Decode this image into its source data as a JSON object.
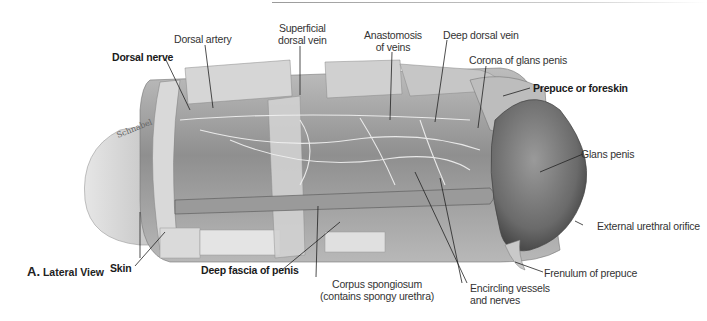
{
  "figure": {
    "panel_letter": "A.",
    "panel_title": "Lateral View",
    "signature": "Schnabel"
  },
  "labels": {
    "dorsal_nerve": "Dorsal nerve",
    "dorsal_artery": "Dorsal artery",
    "superficial_dorsal_vein": [
      "Superficial",
      "dorsal vein"
    ],
    "anastomosis_of_veins": [
      "Anastomosis",
      "of veins"
    ],
    "deep_dorsal_vein": "Deep dorsal vein",
    "corona_of_glans_penis": "Corona of glans penis",
    "prepuce_or_foreskin": "Prepuce or foreskin",
    "glans_penis": "Glans penis",
    "external_urethral_orifice": "External urethral orifice",
    "frenulum_of_prepuce": "Frenulum of prepuce",
    "encircling_vessels_and_nerves": [
      "Encircling vessels",
      "and nerves"
    ],
    "corpus_spongiosum": [
      "Corpus spongiosum",
      "(contains spongy urethra)"
    ],
    "deep_fascia_of_penis": "Deep fascia of penis",
    "skin": "Skin"
  },
  "colors": {
    "label_text": "#333333",
    "leader_line": "#222222",
    "tissue_light": "#dcdcdc",
    "tissue_mid": "#a8a8a8",
    "tissue_dark": "#5a5a5a"
  }
}
